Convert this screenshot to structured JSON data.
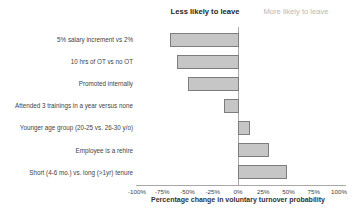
{
  "chart_data": {
    "type": "bar",
    "orientation": "horizontal",
    "title": "",
    "group_label_left": "Less likely to leave",
    "group_label_right": "More likely to leave",
    "categories": [
      "5% salary increment vs 2%",
      "10 hrs of OT vs no OT",
      "Promoted internally",
      "Attended 3 trainings in a year versus none",
      "Younger age group (20-25 vs. 26-30 y/o)",
      "Employee is a rehire",
      "Short (4-6 mo.) vs. long (>1yr) tenure"
    ],
    "values": [
      -67,
      -60,
      -50,
      -14,
      11,
      30,
      48
    ],
    "xlabel": "Percentage change in voluntary turnover probability",
    "xlim": [
      -100,
      100
    ],
    "xticks": [
      -100,
      -75,
      -50,
      -25,
      0,
      25,
      50,
      75,
      100
    ],
    "xtick_labels": [
      "-100%",
      "-75%",
      "-50%",
      "-25%",
      "0%",
      "25%",
      "50%",
      "75%",
      "100%"
    ],
    "grid": false,
    "legend": false,
    "colors": {
      "bar_fill": "#c6c6c6",
      "bar_border": "#7d7d7d",
      "axis_line": "#a8a8a8",
      "text": "#3f3f3f",
      "header_left": "#262626",
      "header_right": "#b9b9b9",
      "background": "#ffffff"
    }
  }
}
